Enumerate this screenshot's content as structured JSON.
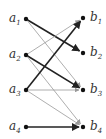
{
  "diagram": {
    "type": "bipartite-directed-graph",
    "left_nodes": [
      {
        "id": "a1",
        "base": "a",
        "sub": "1",
        "x": 26,
        "y": 19
      },
      {
        "id": "a2",
        "base": "a",
        "sub": "2",
        "x": 26,
        "y": 55
      },
      {
        "id": "a3",
        "base": "a",
        "sub": "3",
        "x": 26,
        "y": 90
      },
      {
        "id": "a4",
        "base": "a",
        "sub": "4",
        "x": 26,
        "y": 127
      }
    ],
    "right_nodes": [
      {
        "id": "b1",
        "base": "b",
        "sub": "1",
        "x": 83,
        "y": 18
      },
      {
        "id": "b2",
        "base": "b",
        "sub": "2",
        "x": 83,
        "y": 53
      },
      {
        "id": "b3",
        "base": "b",
        "sub": "3",
        "x": 83,
        "y": 90
      },
      {
        "id": "b4",
        "base": "b",
        "sub": "4",
        "x": 83,
        "y": 127
      }
    ],
    "edges": [
      {
        "from": "a1",
        "to": "b2",
        "weight": "thick"
      },
      {
        "from": "a1",
        "to": "b3",
        "weight": "thin"
      },
      {
        "from": "a2",
        "to": "b1",
        "weight": "thin"
      },
      {
        "from": "a2",
        "to": "b3",
        "weight": "thick"
      },
      {
        "from": "a2",
        "to": "b4",
        "weight": "thin"
      },
      {
        "from": "a3",
        "to": "b1",
        "weight": "thick"
      },
      {
        "from": "a3",
        "to": "b3",
        "weight": "thin"
      },
      {
        "from": "a3",
        "to": "b4",
        "weight": "thin"
      },
      {
        "from": "a4",
        "to": "b4",
        "weight": "thick"
      }
    ],
    "colors": {
      "thick": "#222222",
      "thin": "#999999",
      "node": "#111111"
    }
  }
}
